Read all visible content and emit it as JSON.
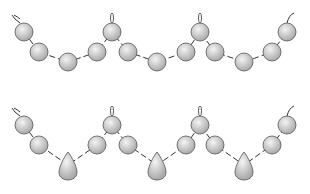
{
  "diagram": {
    "type": "bead-strand-illustration",
    "colors": {
      "bead_fill": "#c8c8c8",
      "bead_highlight": "#f4f4f4",
      "stroke": "#333333",
      "background": "#ffffff"
    },
    "strands": [
      {
        "name": "round-bead-strand",
        "beads": [
          {
            "shape": "ball",
            "x": 24,
            "y": 32
          },
          {
            "shape": "ball",
            "x": 39,
            "y": 52
          },
          {
            "shape": "ball",
            "x": 68,
            "y": 62
          },
          {
            "shape": "ball",
            "x": 97,
            "y": 52
          },
          {
            "shape": "ball",
            "x": 112,
            "y": 32
          },
          {
            "shape": "ball",
            "x": 128,
            "y": 52
          },
          {
            "shape": "ball",
            "x": 157,
            "y": 62
          },
          {
            "shape": "ball",
            "x": 186,
            "y": 52
          },
          {
            "shape": "ball",
            "x": 200,
            "y": 32
          },
          {
            "shape": "ball",
            "x": 215,
            "y": 52
          },
          {
            "shape": "ball",
            "x": 244,
            "y": 62
          },
          {
            "shape": "ball",
            "x": 272,
            "y": 52
          },
          {
            "shape": "ball",
            "x": 287,
            "y": 32
          }
        ]
      },
      {
        "name": "drop-bead-strand",
        "beads": [
          {
            "shape": "ball",
            "x": 24,
            "y": 125
          },
          {
            "shape": "ball",
            "x": 39,
            "y": 145
          },
          {
            "shape": "drop",
            "x": 68,
            "y": 165
          },
          {
            "shape": "ball",
            "x": 97,
            "y": 145
          },
          {
            "shape": "ball",
            "x": 112,
            "y": 125
          },
          {
            "shape": "ball",
            "x": 128,
            "y": 145
          },
          {
            "shape": "drop",
            "x": 157,
            "y": 165
          },
          {
            "shape": "ball",
            "x": 186,
            "y": 145
          },
          {
            "shape": "ball",
            "x": 200,
            "y": 125
          },
          {
            "shape": "ball",
            "x": 215,
            "y": 145
          },
          {
            "shape": "drop",
            "x": 244,
            "y": 165
          },
          {
            "shape": "ball",
            "x": 272,
            "y": 145
          },
          {
            "shape": "ball",
            "x": 287,
            "y": 125
          }
        ]
      }
    ]
  }
}
